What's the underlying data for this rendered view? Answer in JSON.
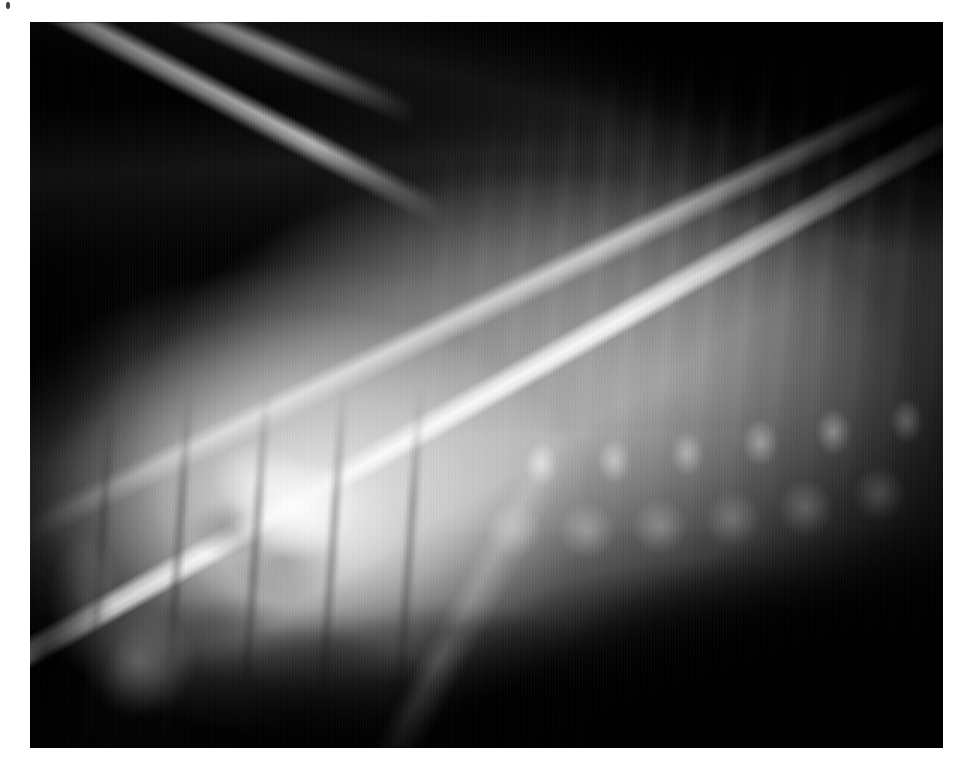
{
  "page": {
    "background_color": "#ffffff",
    "width": 963,
    "height": 771
  },
  "artifact": {
    "name": "speck",
    "label": "dark speck artifact",
    "color": "#2a2a2a"
  },
  "radiograph": {
    "title": "Lateral radiograph",
    "alt_text": "Grayscale lateral radiograph of the cervicothoracic region showing scapula, scapular spine, vertebral bodies, spinous processes, ribs and overlying soft tissue",
    "modality": "X-ray",
    "view": "lateral",
    "colorspace": "grayscale",
    "frame": {
      "left": 30,
      "top": 22,
      "width": 913,
      "height": 726,
      "border_color": "#000000"
    },
    "tones": {
      "air_black": "#000000",
      "soft_tissue_gray": "#9a9a9a",
      "bone_bright": "#f2f2f2",
      "bone_highlight": "#ffffff",
      "background_dark": "#050505"
    },
    "structures": [
      {
        "name": "dorsal-skin-line",
        "label": "Dorsal skin / air interface"
      },
      {
        "name": "scapula-cranial-border",
        "label": "Cranial scapular border"
      },
      {
        "name": "scapular-spine",
        "label": "Scapular spine"
      },
      {
        "name": "scapula-caudal-border",
        "label": "Caudal scapular border"
      },
      {
        "name": "glenohumeral-joint",
        "label": "Shoulder joint"
      },
      {
        "name": "humerus",
        "label": "Humerus"
      },
      {
        "name": "vertebral-bodies",
        "label": "Vertebral bodies"
      },
      {
        "name": "spinous-processes",
        "label": "Dorsal spinous processes"
      },
      {
        "name": "ribs",
        "label": "Ribs"
      },
      {
        "name": "lung-field",
        "label": "Lung field / gas lucency"
      },
      {
        "name": "trachea",
        "label": "Trachea"
      },
      {
        "name": "collimation-edge",
        "label": "Collimation border"
      }
    ]
  }
}
